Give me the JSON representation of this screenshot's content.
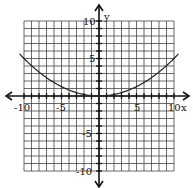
{
  "chart_data": {
    "type": "line",
    "title": "",
    "xlabel": "x",
    "ylabel": "y",
    "xlim": [
      -10,
      10
    ],
    "ylim": [
      -10,
      10
    ],
    "grid": true,
    "x_tick_labels": [
      "-10",
      "-5",
      "5",
      "10"
    ],
    "y_tick_labels": [
      "10",
      "5",
      "-5",
      "-10"
    ],
    "series": [
      {
        "name": "parabola",
        "equation": "y = x^2 / 20",
        "x": [
          -10.5,
          -10,
          -8,
          -6,
          -4,
          -2,
          0,
          2,
          4,
          6,
          8,
          10,
          10.5
        ],
        "values": [
          5.51,
          5.0,
          3.2,
          1.8,
          0.8,
          0.2,
          0,
          0.2,
          0.8,
          1.8,
          3.2,
          5.0,
          5.51
        ]
      }
    ]
  },
  "labels": {
    "x_axis": "x",
    "y_axis": "y",
    "xneg10": "-10",
    "xneg5": "-5",
    "x5": "5",
    "x10": "10",
    "y10": "10",
    "y5": "5",
    "yneg5": "-5",
    "yneg10": "-10"
  }
}
